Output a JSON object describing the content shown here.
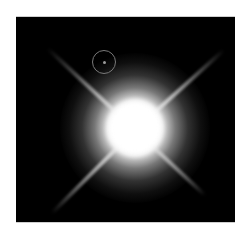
{
  "image": {
    "subject": "bright star with four diffraction spikes and circled faint companion",
    "background_color": "#000000",
    "frame_color": "#ffffff",
    "annotation": {
      "shape": "circle",
      "color": "#7a7a7a",
      "marks": "faint companion object"
    }
  }
}
